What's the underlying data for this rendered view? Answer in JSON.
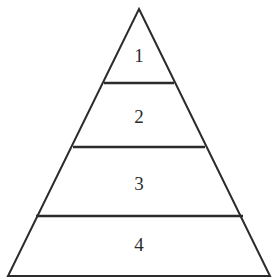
{
  "diagram": {
    "type": "pyramid",
    "title": "",
    "background_color": "#ffffff",
    "stroke_color": "#2b2b2b",
    "label_color": "#2b2b2b",
    "tier_count": 4,
    "apex": {
      "x": 139,
      "y": 9
    },
    "base_left": {
      "x": 8,
      "y": 276
    },
    "base_right": {
      "x": 270,
      "y": 276
    },
    "tiers": [
      {
        "label": "1",
        "order": 1,
        "top_y": 9,
        "bottom_y": 83,
        "left_x_at_bottom": 104,
        "right_x_at_bottom": 174,
        "label_x": 139,
        "label_y": 57
      },
      {
        "label": "2",
        "order": 2,
        "top_y": 83,
        "bottom_y": 147,
        "left_x_at_bottom": 73,
        "right_x_at_bottom": 205,
        "label_x": 139,
        "label_y": 118
      },
      {
        "label": "3",
        "order": 3,
        "top_y": 147,
        "bottom_y": 216,
        "left_x_at_bottom": 36,
        "right_x_at_bottom": 243,
        "label_x": 139,
        "label_y": 185
      },
      {
        "label": "4",
        "order": 4,
        "top_y": 216,
        "bottom_y": 276,
        "left_x_at_bottom": 8,
        "right_x_at_bottom": 270,
        "label_x": 139,
        "label_y": 246
      }
    ],
    "dividers": [
      {
        "y": 83,
        "x1": 104,
        "x2": 174
      },
      {
        "y": 147,
        "x1": 73,
        "x2": 205
      },
      {
        "y": 216,
        "x1": 36,
        "x2": 243
      }
    ]
  }
}
